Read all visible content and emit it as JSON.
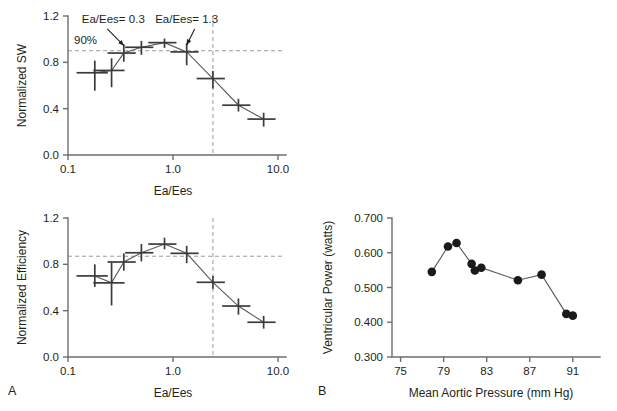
{
  "figure": {
    "panel_a_letter": "A",
    "panel_b_letter": "B"
  },
  "chart_data": [
    {
      "id": "normalized-sw",
      "type": "line",
      "title": "",
      "xlabel": "Ea/Ees",
      "ylabel": "Normalized SW",
      "xscale": "log",
      "xlim": [
        0.1,
        10.0
      ],
      "ylim": [
        0.0,
        1.2
      ],
      "xticks": [
        0.1,
        1.0,
        10.0
      ],
      "xticklabels": [
        "0.1",
        "1.0",
        "10.0"
      ],
      "yticks": [
        0.0,
        0.4,
        0.8,
        1.2
      ],
      "yticklabels": [
        "0.0",
        "0.4",
        "0.8",
        "1.2"
      ],
      "grid": false,
      "legend": "none",
      "x": [
        0.18,
        0.26,
        0.34,
        0.5,
        0.83,
        1.35,
        2.4,
        4.2,
        7.3
      ],
      "values": [
        0.71,
        0.73,
        0.88,
        0.93,
        0.97,
        0.89,
        0.66,
        0.43,
        0.31
      ],
      "yerr_low": [
        0.155,
        0.145,
        0.075,
        0.065,
        0.045,
        0.115,
        0.085,
        0.055,
        0.065
      ],
      "yerr_high": [
        0.105,
        0.105,
        0.075,
        0.055,
        0.035,
        0.075,
        0.065,
        0.055,
        0.055
      ],
      "xerr_frac": [
        0.33,
        0.33,
        0.3,
        0.3,
        0.3,
        0.3,
        0.3,
        0.3,
        0.3
      ],
      "href_value": 0.9,
      "href_label": "90%",
      "vref_value": 2.4,
      "annotations": [
        {
          "text": "Ea/Ees= 0.3",
          "x": 0.27,
          "y": 1.14,
          "arrow_to_x": 0.34,
          "arrow_to_y": 0.945
        },
        {
          "text": "Ea/Ees= 1.3",
          "x": 1.35,
          "y": 1.14,
          "arrow_to_x": 1.35,
          "arrow_to_y": 0.95
        }
      ]
    },
    {
      "id": "normalized-efficiency",
      "type": "line",
      "title": "",
      "xlabel": "Ea/Ees",
      "ylabel": "Normalized Efficiency",
      "xscale": "log",
      "xlim": [
        0.1,
        10.0
      ],
      "ylim": [
        0.0,
        1.2
      ],
      "xticks": [
        0.1,
        1.0,
        10.0
      ],
      "xticklabels": [
        "0.1",
        "1.0",
        "10.0"
      ],
      "yticks": [
        0.0,
        0.4,
        0.8,
        1.2
      ],
      "yticklabels": [
        "0.0",
        "0.4",
        "0.8",
        "1.2"
      ],
      "grid": false,
      "legend": "none",
      "x": [
        0.18,
        0.26,
        0.34,
        0.5,
        0.83,
        1.35,
        2.4,
        4.2,
        7.3
      ],
      "values": [
        0.7,
        0.64,
        0.82,
        0.9,
        0.975,
        0.895,
        0.645,
        0.44,
        0.3
      ],
      "yerr_low": [
        0.095,
        0.195,
        0.075,
        0.075,
        0.045,
        0.085,
        0.055,
        0.075,
        0.055
      ],
      "yerr_high": [
        0.1,
        0.175,
        0.075,
        0.075,
        0.055,
        0.065,
        0.055,
        0.065,
        0.055
      ],
      "xerr_frac": [
        0.33,
        0.33,
        0.3,
        0.3,
        0.3,
        0.3,
        0.3,
        0.3,
        0.3
      ],
      "href_value": 0.87,
      "href_label": "",
      "vref_value": 2.4,
      "annotations": []
    },
    {
      "id": "ventricular-power",
      "type": "scatter",
      "title": "",
      "xlabel": "Mean Aortic Pressure (mm Hg)",
      "ylabel": "Ventricular Power (watts)",
      "xscale": "linear",
      "xlim": [
        74.2,
        92.6
      ],
      "ylim": [
        0.3,
        0.7
      ],
      "xticks": [
        75,
        79,
        83,
        87,
        91
      ],
      "xticklabels": [
        "75",
        "79",
        "83",
        "87",
        "91"
      ],
      "yticks": [
        0.3,
        0.4,
        0.5,
        0.6,
        0.7
      ],
      "yticklabels": [
        "0.300",
        "0.400",
        "0.500",
        "0.600",
        "0.700"
      ],
      "grid": false,
      "legend": "none",
      "connected": true,
      "x": [
        77.9,
        79.4,
        80.2,
        81.6,
        81.9,
        82.5,
        85.9,
        88.1,
        90.4,
        91.0
      ],
      "values": [
        0.545,
        0.618,
        0.628,
        0.568,
        0.549,
        0.557,
        0.521,
        0.537,
        0.424,
        0.419
      ]
    }
  ]
}
